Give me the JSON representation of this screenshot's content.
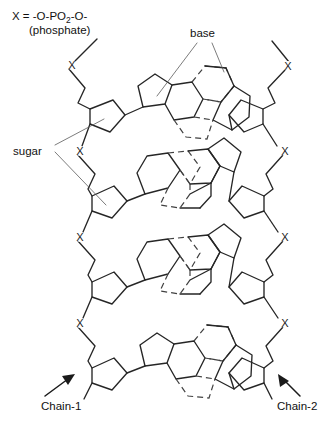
{
  "figure": {
    "background_color": "#ffffff",
    "line_color": "#262626",
    "hbond_color": "#404040",
    "leader_color": "#5a5a5a",
    "width": 331,
    "height": 425
  },
  "legend": {
    "formula_prefix": "X = -O-PO",
    "formula_subscript": "2",
    "formula_suffix": "-O-",
    "formula_full": "X = -O-PO2-O-",
    "formula_note": "(phosphate)"
  },
  "labels": {
    "base": "base",
    "sugar": "sugar",
    "chain_1": "Chain-1",
    "chain_2": "Chain-2",
    "phosphate_marker": "X"
  },
  "structure": {
    "backbone_count": 2,
    "base_pair_rungs": 4,
    "phosphate_markers_per_chain": 4,
    "sugar_rings_per_chain": 4,
    "rung_orientations": [
      "purine-left-pyrimidine-right",
      "pyrimidine-left-purine-right",
      "pyrimidine-left-purine-right",
      "purine-left-pyrimidine-right"
    ]
  },
  "phosphate_markers": {
    "left": [
      "X",
      "X",
      "X",
      "X"
    ],
    "right": [
      "X",
      "X",
      "X",
      "X"
    ]
  }
}
